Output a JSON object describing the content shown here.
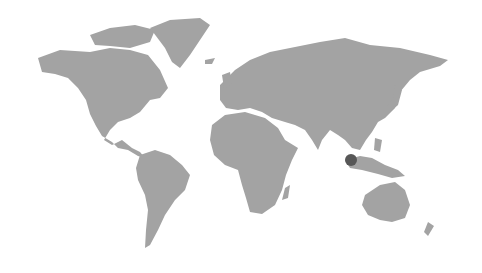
{
  "map": {
    "type": "world-dotted",
    "land_color": "#a3a3a3",
    "background": "#ffffff",
    "markers": [
      {
        "label": "",
        "region": "Southeast Asia (Singapore/Malaysia)",
        "x": 351,
        "y": 160,
        "r": 6,
        "color": "#575757"
      }
    ]
  }
}
